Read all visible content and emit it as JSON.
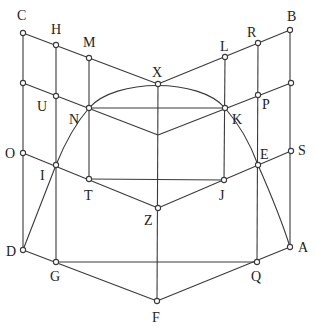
{
  "diagram": {
    "type": "geometric-construction",
    "stroke_color": "#3a3a3a",
    "background": "#ffffff",
    "points": {
      "C": {
        "x": 23,
        "y": 33,
        "label": "C",
        "lx": 17,
        "ly": 20,
        "marker": true
      },
      "H": {
        "x": 56,
        "y": 45,
        "label": "H",
        "lx": 51,
        "ly": 34,
        "marker": true
      },
      "M": {
        "x": 89,
        "y": 58,
        "label": "M",
        "lx": 83,
        "ly": 47,
        "marker": true
      },
      "X": {
        "x": 158,
        "y": 84,
        "label": "X",
        "lx": 152,
        "ly": 77,
        "marker": true
      },
      "L": {
        "x": 225,
        "y": 57,
        "label": "L",
        "lx": 220,
        "ly": 51,
        "marker": true
      },
      "R": {
        "x": 258,
        "y": 43,
        "label": "R",
        "lx": 247,
        "ly": 37,
        "marker": true
      },
      "B": {
        "x": 290,
        "y": 30,
        "label": "B",
        "lx": 287,
        "ly": 21,
        "marker": true
      },
      "LM": {
        "x": 23,
        "y": 83,
        "label": "",
        "lx": 0,
        "ly": 0,
        "marker": true
      },
      "U": {
        "x": 56,
        "y": 96,
        "label": "U",
        "lx": 37,
        "ly": 111,
        "marker": true
      },
      "N": {
        "x": 89,
        "y": 108,
        "label": "N",
        "lx": 69,
        "ly": 124,
        "marker": true
      },
      "CT": {
        "x": 158,
        "y": 135,
        "label": "",
        "lx": 0,
        "ly": 0,
        "marker": false
      },
      "K": {
        "x": 225,
        "y": 108,
        "label": "K",
        "lx": 232,
        "ly": 124,
        "marker": true
      },
      "P": {
        "x": 258,
        "y": 95,
        "label": "P",
        "lx": 262,
        "ly": 109,
        "marker": true
      },
      "RM": {
        "x": 291,
        "y": 83,
        "label": "",
        "lx": 0,
        "ly": 0,
        "marker": true
      },
      "O": {
        "x": 23,
        "y": 153,
        "label": "O",
        "lx": 5,
        "ly": 158,
        "marker": true
      },
      "I": {
        "x": 56,
        "y": 165,
        "label": "I",
        "lx": 40,
        "ly": 180,
        "marker": true
      },
      "T": {
        "x": 89,
        "y": 179,
        "label": "T",
        "lx": 84,
        "ly": 200,
        "marker": true
      },
      "Z": {
        "x": 158,
        "y": 208,
        "label": "Z",
        "lx": 144,
        "ly": 225,
        "marker": true
      },
      "J": {
        "x": 224,
        "y": 180,
        "label": "J",
        "lx": 219,
        "ly": 200,
        "marker": true
      },
      "E": {
        "x": 258,
        "y": 165,
        "label": "E",
        "lx": 260,
        "ly": 159,
        "marker": true
      },
      "S": {
        "x": 291,
        "y": 151,
        "label": "S",
        "lx": 298,
        "ly": 155,
        "marker": true
      },
      "D": {
        "x": 23,
        "y": 250,
        "label": "D",
        "lx": 6,
        "ly": 256,
        "marker": true
      },
      "G": {
        "x": 56,
        "y": 262,
        "label": "G",
        "lx": 50,
        "ly": 281,
        "marker": true
      },
      "F": {
        "x": 157,
        "y": 301,
        "label": "F",
        "lx": 152,
        "ly": 322,
        "marker": true
      },
      "Q": {
        "x": 257,
        "y": 262,
        "label": "Q",
        "lx": 251,
        "ly": 281,
        "marker": true
      },
      "A": {
        "x": 290,
        "y": 247,
        "label": "A",
        "lx": 298,
        "ly": 252,
        "marker": true
      }
    },
    "edges": [
      [
        "C",
        "X"
      ],
      [
        "X",
        "B"
      ],
      [
        "LM",
        "CT"
      ],
      [
        "CT",
        "RM"
      ],
      [
        "O",
        "Z"
      ],
      [
        "Z",
        "S"
      ],
      [
        "D",
        "F"
      ],
      [
        "F",
        "A"
      ],
      [
        "C",
        "D"
      ],
      [
        "H",
        "G"
      ],
      [
        "M",
        "T"
      ],
      [
        "X",
        "F"
      ],
      [
        "L",
        "J"
      ],
      [
        "R",
        "Q"
      ],
      [
        "B",
        "A"
      ],
      [
        "N",
        "K"
      ],
      [
        "T",
        "J"
      ],
      [
        "G",
        "Q"
      ]
    ],
    "arc": {
      "through": [
        "D",
        "I",
        "N",
        "X",
        "K",
        "E",
        "A"
      ],
      "path": "M 23 250 L 56 165 Q 70 130 89 108 C 115 78 200 78 225 108 Q 246 132 258 165 Q 280 215 290 247"
    },
    "labels": [
      "C",
      "H",
      "M",
      "X",
      "L",
      "R",
      "B",
      "U",
      "N",
      "K",
      "P",
      "O",
      "I",
      "T",
      "Z",
      "J",
      "E",
      "S",
      "D",
      "G",
      "F",
      "Q",
      "A"
    ]
  }
}
